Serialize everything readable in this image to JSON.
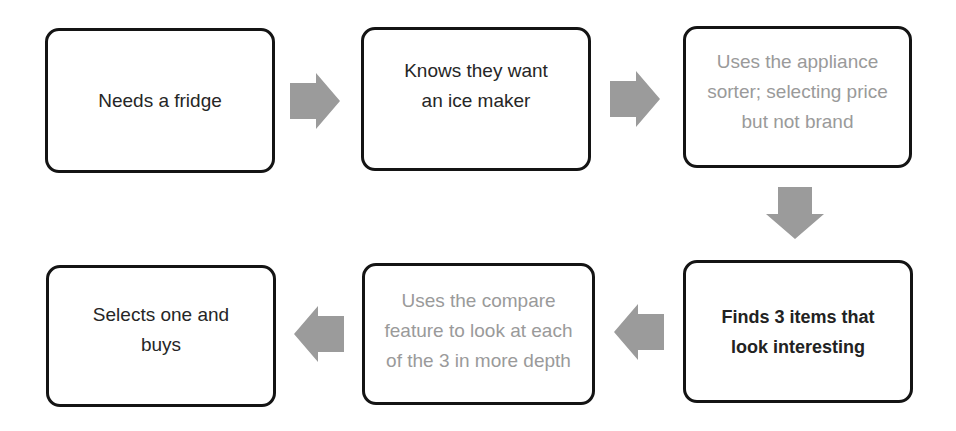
{
  "diagram": {
    "type": "flowchart",
    "colors": {
      "box_border": "#141414",
      "text_dark": "#262626",
      "text_muted": "#9a9a9a",
      "arrow": "#9b9b9b"
    },
    "steps": [
      {
        "id": 1,
        "label": "Needs a fridge",
        "style": "normal"
      },
      {
        "id": 2,
        "label": "Knows they want an ice maker",
        "style": "normal"
      },
      {
        "id": 3,
        "label": "Uses the appliance sorter; selecting price but not brand",
        "style": "muted"
      },
      {
        "id": 4,
        "label": "Finds 3 items that look interesting",
        "style": "bold"
      },
      {
        "id": 5,
        "label": "Uses the compare feature to look at each of the 3 in more depth",
        "style": "muted"
      },
      {
        "id": 6,
        "label": "Selects one and buys",
        "style": "normal"
      }
    ],
    "arrows": [
      {
        "from": 1,
        "to": 2,
        "direction": "right"
      },
      {
        "from": 2,
        "to": 3,
        "direction": "right"
      },
      {
        "from": 3,
        "to": 4,
        "direction": "down"
      },
      {
        "from": 4,
        "to": 5,
        "direction": "left"
      },
      {
        "from": 5,
        "to": 6,
        "direction": "left"
      }
    ]
  }
}
